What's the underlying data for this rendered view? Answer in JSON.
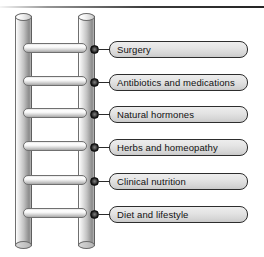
{
  "diagram": {
    "colors": {
      "box_border": "#2d2d2d",
      "box_fill": "#e4e4e4",
      "rail_fill": "#c2c2c2",
      "knob": "#111111",
      "text": "#111111",
      "background": "#ffffff"
    },
    "ladder": {
      "name": "ladder-graphic",
      "rail_count": 2,
      "rung_count": 6
    },
    "steps": [
      {
        "index": 1,
        "label": "Surgery",
        "y": 42
      },
      {
        "index": 2,
        "label": "Antibiotics and medications",
        "y": 75
      },
      {
        "index": 3,
        "label": "Natural hormones",
        "y": 107
      },
      {
        "index": 4,
        "label": "Herbs and homeopathy",
        "y": 140
      },
      {
        "index": 5,
        "label": "Clinical nutrition",
        "y": 174
      },
      {
        "index": 6,
        "label": "Diet and lifestyle",
        "y": 207
      }
    ]
  }
}
